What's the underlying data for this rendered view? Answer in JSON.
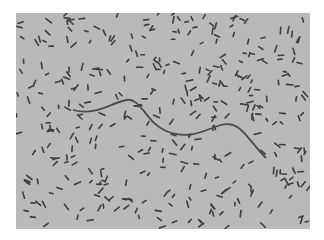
{
  "image": {
    "subject": "phase-contrast micrograph of rod-shaped bacteria with a single long filamentous cell",
    "colors": {
      "background": "#ffffff",
      "field": "#b9b9b9",
      "cells": "#3a3a3a"
    },
    "filament_path": "M57 97 C80 103 95 90 110 87 C125 84 130 110 150 118 C175 128 190 116 205 112 C225 107 230 125 250 145"
  }
}
